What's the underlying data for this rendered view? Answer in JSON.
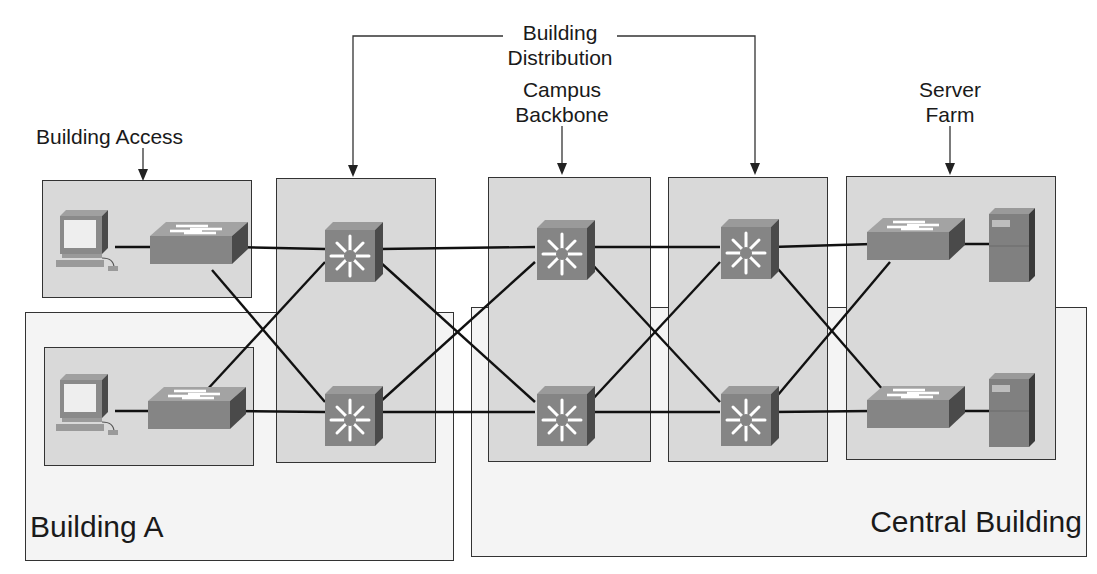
{
  "labels": {
    "building_access": "Building Access",
    "building_distribution_1": "Building",
    "building_distribution_2": "Distribution",
    "campus_backbone_1": "Campus",
    "campus_backbone_2": "Backbone",
    "server_farm_1": "Server",
    "server_farm_2": "Farm",
    "building_a": "Building A",
    "central_building": "Central Building"
  },
  "modules": [
    {
      "name": "Building Access",
      "devices": [
        "workstation",
        "workstation",
        "access-switch",
        "access-switch"
      ]
    },
    {
      "name": "Building Distribution (Building A)",
      "devices": [
        "multilayer-switch",
        "multilayer-switch"
      ]
    },
    {
      "name": "Campus Backbone",
      "devices": [
        "multilayer-switch",
        "multilayer-switch"
      ]
    },
    {
      "name": "Building Distribution (Central Building)",
      "devices": [
        "multilayer-switch",
        "multilayer-switch"
      ]
    },
    {
      "name": "Server Farm",
      "devices": [
        "access-switch",
        "access-switch",
        "server",
        "server"
      ]
    }
  ],
  "colors": {
    "outer_fill": "#f4f4f4",
    "inner_fill": "#d9d9d9",
    "device_face": "#8a8a8a",
    "device_side": "#4a4a4a",
    "link": "#111111"
  }
}
